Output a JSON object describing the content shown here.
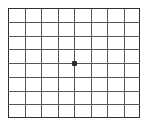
{
  "chart_data": {
    "type": "scatter",
    "title": "",
    "subtitle": "",
    "xlabel": "",
    "ylabel": "",
    "grid": true,
    "legend": false,
    "legend_position": "none",
    "xlim": [
      0,
      8
    ],
    "ylim": [
      0,
      8
    ],
    "xticks": [
      0,
      1,
      2,
      3,
      4,
      5,
      6,
      7,
      8
    ],
    "yticks": [
      0,
      1,
      2,
      3,
      4,
      5,
      6,
      7,
      8
    ],
    "xticklabels": [
      "",
      "",
      "",
      "",
      "",
      "",
      "",
      "",
      ""
    ],
    "yticklabels": [
      "",
      "",
      "",
      "",
      "",
      "",
      "",
      "",
      ""
    ],
    "columns": 8,
    "rows": 8,
    "series": [
      {
        "name": "center-point",
        "marker": "square",
        "x": [
          4
        ],
        "y": [
          4
        ],
        "values": [
          4
        ]
      }
    ],
    "annotations": []
  },
  "figure": {
    "width_px": 149,
    "height_px": 125,
    "background_color": "#ffffff"
  },
  "plot": {
    "left_px": 8,
    "top_px": 8,
    "width_px": 132,
    "height_px": 110,
    "cell_width_px": 16.5,
    "cell_height_px": 13.75,
    "grid_color": "#55555a",
    "border_color": "#2e2e33",
    "background_color": "#ffffff"
  },
  "marker": {
    "label": "center-point",
    "x_px": 74,
    "y_px": 63,
    "size_px": 5,
    "color": "#2b2b30"
  }
}
